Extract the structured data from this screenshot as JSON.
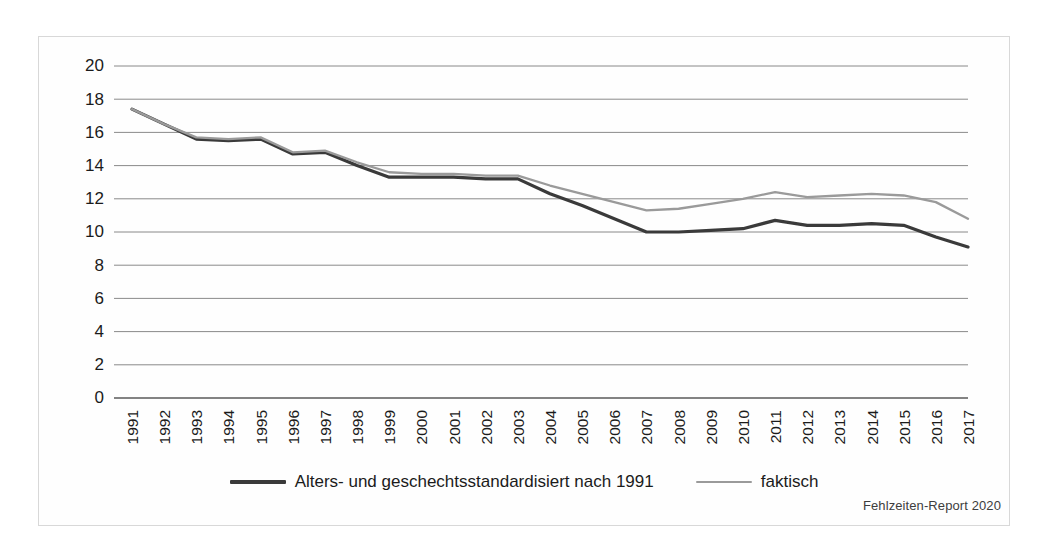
{
  "figure": {
    "source_note": "Fehlzeiten-Report 2020"
  },
  "legend": {
    "position": "bottom-center",
    "entries": [
      {
        "label": "Alters- und geschechtsstandardisiert nach 1991",
        "color": "#3a3a3a",
        "swatch": "line-swatch-dark"
      },
      {
        "label": "faktisch",
        "color": "#9a9a9a",
        "swatch": "line-swatch-light"
      }
    ]
  },
  "chart_data": {
    "type": "line",
    "title": "",
    "subtitle": "",
    "xlabel": "",
    "ylabel": "",
    "grid": true,
    "legend_position": "bottom-center",
    "ylim": [
      0,
      20
    ],
    "yticks": [
      0,
      2,
      4,
      6,
      8,
      10,
      12,
      14,
      16,
      18,
      20
    ],
    "ytick_labels": [
      "0",
      "2",
      "4",
      "6",
      "8",
      "10",
      "12",
      "14",
      "16",
      "18",
      "20"
    ],
    "categories": [
      "1991",
      "1992",
      "1993",
      "1994",
      "1995",
      "1996",
      "1997",
      "1998",
      "1999",
      "2000",
      "2001",
      "2002",
      "2003",
      "2004",
      "2005",
      "2006",
      "2007",
      "2008",
      "2009",
      "2010",
      "2011",
      "2012",
      "2013",
      "2014",
      "2015",
      "2016",
      "2017"
    ],
    "xtick_labels": [
      "1991",
      "1992",
      "1993",
      "1994",
      "1995",
      "1996",
      "1997",
      "1998",
      "1999",
      "2000",
      "2001",
      "2002",
      "2003",
      "2004",
      "2005",
      "2006",
      "2007",
      "2008",
      "2009",
      "2010",
      "2011",
      "2012",
      "2013",
      "2014",
      "2015",
      "2016",
      "2017"
    ],
    "xtick_rotation": 90,
    "series": [
      {
        "name": "Alters- und geschechtsstandardisiert nach 1991",
        "color": "#3a3a3a",
        "width": 3.2,
        "values": [
          17.4,
          16.5,
          15.6,
          15.5,
          15.6,
          14.7,
          14.8,
          14.0,
          13.3,
          13.3,
          13.3,
          13.2,
          13.2,
          12.3,
          11.6,
          10.8,
          10.0,
          10.0,
          10.1,
          10.2,
          10.7,
          10.4,
          10.4,
          10.5,
          10.4,
          9.7,
          9.1
        ]
      },
      {
        "name": "faktisch",
        "color": "#9a9a9a",
        "width": 2.3,
        "values": [
          17.4,
          16.5,
          15.7,
          15.6,
          15.7,
          14.8,
          14.9,
          14.2,
          13.6,
          13.5,
          13.5,
          13.4,
          13.4,
          12.8,
          12.3,
          11.8,
          11.3,
          11.4,
          11.7,
          12.0,
          12.4,
          12.1,
          12.2,
          12.3,
          12.2,
          11.8,
          10.8
        ]
      }
    ]
  },
  "axes": {
    "plot_left": 132,
    "plot_right": 968,
    "plot_top": 66,
    "plot_bottom": 398
  }
}
